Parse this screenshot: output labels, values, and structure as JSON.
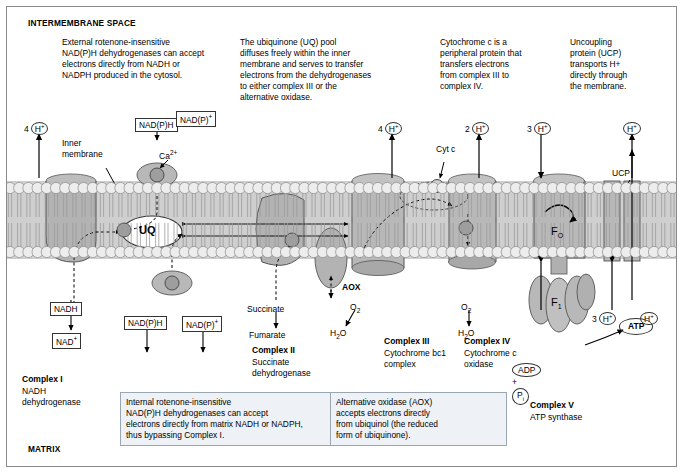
{
  "figure": {
    "top_label": "INTERMEMBRANE SPACE",
    "bottom_label": "MATRIX"
  },
  "notes": [
    {
      "id": "note-external-nadph",
      "text": "External rotenone-insensitive\nNAD(P)H dehydrogenases can accept\nelectrons directly from NADH or\nNADPH produced in the cytosol."
    },
    {
      "id": "note-uq-pool",
      "text": "The ubiquinone (UQ) pool\ndiffuses freely within the inner\nmembrane and serves to transfer\nelectrons from the dehydrogenases\nto either complex III or the\nalternative oxidase."
    },
    {
      "id": "note-cytochrome-c",
      "text": "Cytochrome c is a\nperipheral protein that\ntransfers electrons\nfrom complex III to\ncomplex IV."
    },
    {
      "id": "note-ucp",
      "text": "Uncoupling\nprotein (UCP)\ntransports H+\ndirectly through\nthe membrane."
    },
    {
      "id": "note-internal-nadph",
      "text": "Internal rotenone-insensitive\nNAD(P)H dehydrogenases can accept\nelectrons directly from matrix NADH or NADPH,\nthus bypassing Complex I."
    },
    {
      "id": "note-aox",
      "text": "Alternative oxidase (AOX)\naccepts electrons directly\nfrom ubiquinol (the reduced\nform of ubiquinone)."
    }
  ],
  "complexes": [
    {
      "id": "complex-i",
      "name": "Complex I",
      "sub": "NADH\ndehydrogenase"
    },
    {
      "id": "complex-ii",
      "name": "Complex II",
      "sub": "Succinate\ndehydrogenase"
    },
    {
      "id": "complex-iii",
      "name": "Complex III",
      "sub": "Cytochrome bc1\ncomplex"
    },
    {
      "id": "complex-iv",
      "name": "Complex IV",
      "sub": "Cytochrome c\noxidase"
    },
    {
      "id": "complex-v",
      "name": "Complex V",
      "sub": "ATP synthase"
    }
  ],
  "labels": {
    "inner_membrane": "Inner\nmembrane",
    "uq": "UQ",
    "aox": "AOX",
    "ucp": "UCP",
    "cyt_c": "Cyt c",
    "fo": "F",
    "fo_sub": "O",
    "f1": "F",
    "f1_sub": "1",
    "ca": "Ca",
    "ca_sup": "2+",
    "succinate": "Succinate",
    "fumarate": "Fumarate",
    "o2_ii": "O",
    "o2_sub": "2",
    "h2o_ii": "H",
    "h2o_sub": "2",
    "h2o_end": "O",
    "o2_iv": "O",
    "h2o_iv": "H",
    "atp": "ATP",
    "adp": "ADP",
    "pi": "P",
    "pi_sub": "i",
    "plus": "+"
  },
  "tags": [
    {
      "id": "tag-nadph-outer",
      "text": "NAD(P)H"
    },
    {
      "id": "tag-nadp-outer",
      "text": "NAD(P)"
    },
    {
      "id": "tag-nadh",
      "text": "NADH"
    },
    {
      "id": "tag-nad",
      "text": "NAD"
    },
    {
      "id": "tag-nadph-inner",
      "text": "NAD(P)H"
    },
    {
      "id": "tag-nadp-inner",
      "text": "NAD(P)"
    }
  ],
  "protons": [
    {
      "id": "proton-4h-left",
      "count": "4",
      "sym": "H",
      "charge": "+"
    },
    {
      "id": "proton-4h-mid",
      "count": "4",
      "sym": "H",
      "charge": "+"
    },
    {
      "id": "proton-2h",
      "count": "2",
      "sym": "H",
      "charge": "+"
    },
    {
      "id": "proton-3h-top",
      "count": "3",
      "sym": "H",
      "charge": "+"
    },
    {
      "id": "proton-h-ucp-top",
      "count": "",
      "sym": "H",
      "charge": "+"
    },
    {
      "id": "proton-3h-bottom",
      "count": "3",
      "sym": "H",
      "charge": "+"
    },
    {
      "id": "proton-h-ucp-bottom",
      "count": "",
      "sym": "H",
      "charge": "+"
    }
  ],
  "colors": {
    "membrane_fill": "#cfcfcf",
    "complex_fill": "#b3b3b3",
    "note_box_fill": "#eef2f6",
    "border": "#333333"
  }
}
